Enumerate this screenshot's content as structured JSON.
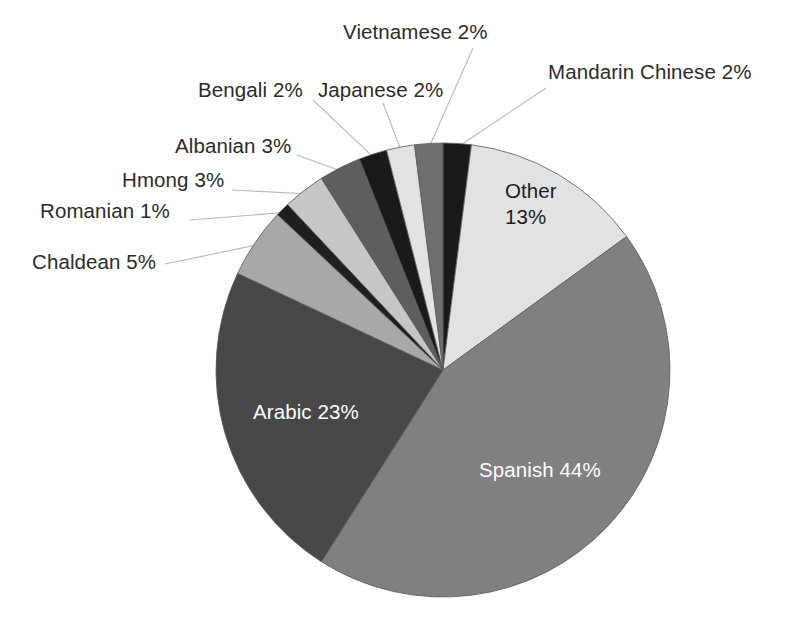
{
  "chart_data": {
    "type": "pie",
    "title": "",
    "subtitle": "",
    "xlabel": "",
    "ylabel": "",
    "legend_position": "none",
    "grid": false,
    "units": "percent",
    "start_angle_deg": 0,
    "direction": "clockwise",
    "categories": [
      "Mandarin Chinese",
      "Other",
      "Spanish",
      "Arabic",
      "Chaldean",
      "Romanian",
      "Hmong",
      "Albanian",
      "Bengali",
      "Japanese",
      "Vietnamese"
    ],
    "values": [
      2,
      13,
      44,
      23,
      5,
      1,
      3,
      3,
      2,
      2,
      2
    ],
    "slices": [
      {
        "name": "Mandarin Chinese",
        "value": 2,
        "value_text": "2%",
        "label": "Mandarin Chinese 2%",
        "color": "#1a1a1a",
        "label_placement": "callout",
        "label_color": "#2b2b2b"
      },
      {
        "name": "Other",
        "value": 13,
        "value_text": "13%",
        "label": "Other 13%",
        "label_line1": "Other",
        "label_line2": "13%",
        "color": "#e2e2e2",
        "label_placement": "inside",
        "label_color": "#1c1c1c"
      },
      {
        "name": "Spanish",
        "value": 44,
        "value_text": "44%",
        "label": "Spanish 44%",
        "color": "#808080",
        "label_placement": "inside",
        "label_color": "#ffffff"
      },
      {
        "name": "Arabic",
        "value": 23,
        "value_text": "23%",
        "label": "Arabic 23%",
        "color": "#474747",
        "label_placement": "inside",
        "label_color": "#ffffff"
      },
      {
        "name": "Chaldean",
        "value": 5,
        "value_text": "5%",
        "label": "Chaldean 5%",
        "color": "#a8a8a8",
        "label_placement": "callout",
        "label_color": "#2b2b2b"
      },
      {
        "name": "Romanian",
        "value": 1,
        "value_text": "1%",
        "label": "Romanian 1%",
        "color": "#1f1f1f",
        "label_placement": "callout",
        "label_color": "#2b2b2b"
      },
      {
        "name": "Hmong",
        "value": 3,
        "value_text": "3%",
        "label": "Hmong 3%",
        "color": "#c6c6c6",
        "label_placement": "callout",
        "label_color": "#2b2b2b"
      },
      {
        "name": "Albanian",
        "value": 3,
        "value_text": "3%",
        "label": "Albanian 3%",
        "color": "#5e5e5e",
        "label_placement": "callout",
        "label_color": "#2b2b2b"
      },
      {
        "name": "Bengali",
        "value": 2,
        "value_text": "2%",
        "label": "Bengali 2%",
        "color": "#1a1a1a",
        "label_placement": "callout",
        "label_color": "#2b2b2b"
      },
      {
        "name": "Japanese",
        "value": 2,
        "value_text": "2%",
        "label": "Japanese 2%",
        "color": "#e2e2e2",
        "label_placement": "callout",
        "label_color": "#2b2b2b"
      },
      {
        "name": "Vietnamese",
        "value": 2,
        "value_text": "2%",
        "label": "Vietnamese 2%",
        "color": "#6e6e6e",
        "label_placement": "callout",
        "label_color": "#2b2b2b"
      }
    ]
  },
  "labels": {
    "vietnamese": "Vietnamese 2%",
    "mandarin_chinese": "Mandarin Chinese 2%",
    "bengali": "Bengali 2%",
    "japanese": "Japanese 2%",
    "albanian": "Albanian 3%",
    "hmong": "Hmong 3%",
    "romanian": "Romanian 1%",
    "chaldean": "Chaldean 5%",
    "other_line1": "Other",
    "other_line2": "13%",
    "arabic": "Arabic 23%",
    "spanish": "Spanish 44%"
  },
  "colors": {
    "background": "#ffffff",
    "label_text": "#2b2b2b",
    "inside_label_light": "#ffffff",
    "inside_label_dark": "#1c1c1c",
    "leader_line": "#b9b9b9",
    "pie_outline": "#5a5a5a"
  },
  "geometry": {
    "center_x": 443,
    "center_y": 370,
    "radius": 227
  }
}
